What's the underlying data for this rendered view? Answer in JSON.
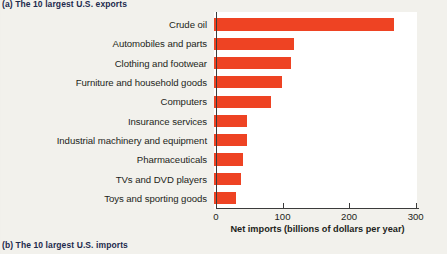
{
  "captions": {
    "panel_a": "(a) The 10 largest U.S. exports",
    "panel_b": "(b) The 10 largest U.S. imports"
  },
  "colors": {
    "bar": "#EE4323",
    "axis": "#3B3B3B",
    "plot_background": "#FFFFFF",
    "page_background": "#F2F1EC",
    "caption_text": "#1D2A4D"
  },
  "axis": {
    "x_title": "Net imports (billions of dollars per year)",
    "ticks": [
      "0",
      "100",
      "200",
      "300"
    ]
  },
  "chart_data": {
    "type": "bar",
    "orientation": "horizontal",
    "title": "(b) The 10 largest U.S. imports",
    "xlabel": "Net imports (billions of dollars per year)",
    "ylabel": "",
    "xlim": [
      0,
      305
    ],
    "xticks": [
      0,
      100,
      200,
      300
    ],
    "grid": false,
    "legend": false,
    "categories": [
      "Crude oil",
      "Automobiles and parts",
      "Clothing and footwear",
      "Furniture and household goods",
      "Computers",
      "Insurance services",
      "Industrial machinery and equipment",
      "Pharmaceuticals",
      "TVs and DVD players",
      "Toys and sporting goods"
    ],
    "values": [
      271,
      120,
      116,
      102,
      85,
      50,
      50,
      44,
      40,
      33
    ],
    "units": "billions of dollars per year"
  }
}
